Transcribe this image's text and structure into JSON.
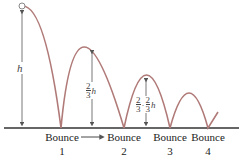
{
  "diagram": {
    "curve_color": "#b07a78",
    "arrow_color": "#555555",
    "heights": {
      "first": "h",
      "second": {
        "num": "2",
        "den": "3",
        "var": "h"
      },
      "third": {
        "num1": "2",
        "den1": "3",
        "sep": "·",
        "num2": "2",
        "den2": "3",
        "var": "h"
      }
    },
    "bounces": [
      {
        "label": "Bounce",
        "num": "1"
      },
      {
        "label": "Bounce",
        "num": "2"
      },
      {
        "label": "Bounce",
        "num": "3"
      },
      {
        "label": "Bounce",
        "num": "4"
      }
    ]
  }
}
